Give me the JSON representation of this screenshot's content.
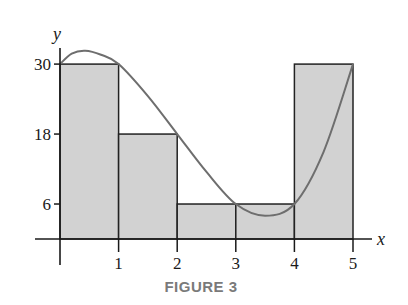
{
  "caption": "FIGURE 3",
  "colors": {
    "fill": "#d2d2d2",
    "rect_stroke": "#222222",
    "curve": "#6e6e6e",
    "axis": "#1a1a1a",
    "caption": "#7a7a7a"
  },
  "chart_data": {
    "type": "bar",
    "title": "FIGURE 3",
    "xlabel": "x",
    "ylabel": "y",
    "xlim": [
      0,
      5
    ],
    "ylim": [
      0,
      30
    ],
    "x_ticks": [
      1,
      2,
      3,
      4,
      5
    ],
    "y_ticks": [
      6,
      18,
      30
    ],
    "grid": false,
    "legend": null,
    "bars": [
      {
        "x_start": 0,
        "x_end": 1,
        "height": 30
      },
      {
        "x_start": 1,
        "x_end": 2,
        "height": 18
      },
      {
        "x_start": 2,
        "x_end": 3,
        "height": 6
      },
      {
        "x_start": 3,
        "x_end": 4,
        "height": 6
      },
      {
        "x_start": 4,
        "x_end": 5,
        "height": 30
      }
    ],
    "categories": [
      "[0,1]",
      "[1,2]",
      "[2,3]",
      "[3,4]",
      "[4,5]"
    ],
    "values": [
      30,
      18,
      6,
      6,
      30
    ],
    "curve": {
      "type": "line",
      "description": "smooth curve y = f(x) approximated by right-endpoint rectangles",
      "points": [
        [
          0,
          30
        ],
        [
          0.2,
          31.8
        ],
        [
          0.43,
          32.3
        ],
        [
          0.7,
          31.6
        ],
        [
          1,
          30
        ],
        [
          1.5,
          24.5
        ],
        [
          2,
          18
        ],
        [
          2.5,
          11.5
        ],
        [
          3,
          6
        ],
        [
          3.5,
          4
        ],
        [
          4,
          6
        ],
        [
          4.5,
          15
        ],
        [
          5,
          30
        ]
      ]
    }
  }
}
